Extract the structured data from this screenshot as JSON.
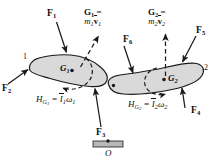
{
  "figure": {
    "background_color": "#ffffff",
    "body_fill": "#d9d9d9",
    "body_stroke": "#1a1a1a",
    "ground_fill": "#b8b8b8"
  },
  "bodies": [
    {
      "id": "body-1",
      "number_label": "1",
      "center_label": "G",
      "center_sub": "1"
    },
    {
      "id": "body-2",
      "number_label": "2",
      "center_label": "G",
      "center_sub": "2"
    }
  ],
  "forces": [
    {
      "name": "F1",
      "symbol": "F",
      "sub": "1"
    },
    {
      "name": "F2",
      "symbol": "F",
      "sub": "2"
    },
    {
      "name": "F3",
      "symbol": "F",
      "sub": "3"
    },
    {
      "name": "F4",
      "symbol": "F",
      "sub": "4"
    },
    {
      "name": "F5",
      "symbol": "F",
      "sub": "5"
    },
    {
      "name": "F6",
      "symbol": "F",
      "sub": "6"
    }
  ],
  "momentum_vectors": [
    {
      "name": "G1-momentum",
      "line1_symbol": "G",
      "line1_sub": "1",
      "line1_eq": " =",
      "line2_mass": "m",
      "line2_mass_sub": "1",
      "line2_vel": "v",
      "line2_vel_sub": "1"
    },
    {
      "name": "G2-momentum",
      "line1_symbol": "G",
      "line1_sub": "2",
      "line1_eq": " =",
      "line2_mass": "m",
      "line2_mass_sub": "2",
      "line2_vel": "v",
      "line2_vel_sub": "2"
    }
  ],
  "angular_momenta": [
    {
      "name": "HG1",
      "h": "H",
      "h_sub": "G",
      "h_sub_sub": "1",
      "eq": " = ",
      "inertia": "I",
      "inertia_sub": "1",
      "omega": "ω",
      "omega_sub": "1"
    },
    {
      "name": "HG2",
      "h": "H",
      "h_sub": "G",
      "h_sub_sub": "2",
      "eq": " = ",
      "inertia": "I",
      "inertia_sub": "2",
      "omega": "ω",
      "omega_sub": "2"
    }
  ],
  "ground_reference": {
    "name": "origin-O",
    "label": "O"
  }
}
